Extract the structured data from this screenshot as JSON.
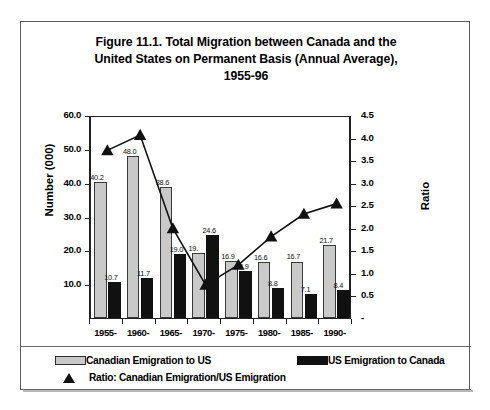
{
  "figure": {
    "title_lines": [
      "Figure 11.1. Total Migration between Canada and the",
      "United States on Permanent Basis (Annual Average),",
      "1955-96"
    ]
  },
  "axes": {
    "left_label": "Number (000)",
    "right_label": "Ratio",
    "left_ticks": [
      "60.0",
      "50.0",
      "40.0",
      "30.0",
      "20.0",
      "10.0"
    ],
    "right_ticks": [
      "4.5",
      "4.0",
      "3.5",
      "3.0",
      "2.5",
      "2.0",
      "1.5",
      "1.0",
      "0.5",
      "-"
    ]
  },
  "legend": {
    "items": [
      {
        "key": "canadian",
        "label": "Canadian Emigration to US",
        "marker": "light-swatch",
        "color": "#c9c9c9"
      },
      {
        "key": "us",
        "label": "US Emigration to Canada",
        "marker": "dark-swatch",
        "color": "#111111"
      },
      {
        "key": "ratio",
        "label": "Ratio: Canadian Emigration/US Emigration",
        "marker": "triangle",
        "color": "#111111"
      }
    ]
  },
  "chart_data": {
    "type": "bar",
    "title": "Figure 11.1. Total Migration between Canada and the United States on Permanent Basis (Annual Average), 1955-96",
    "xlabel": "",
    "ylabel": "Number (000)",
    "y2label": "Ratio",
    "categories": [
      "1955-",
      "1960-",
      "1965-",
      "1970-",
      "1975-",
      "1980-",
      "1985-",
      "1990-"
    ],
    "ylim": [
      0,
      60
    ],
    "y2lim": [
      0,
      4.5
    ],
    "grid": false,
    "legend_position": "bottom",
    "series": [
      {
        "name": "Canadian Emigration to US",
        "type": "bar",
        "axis": "left",
        "color": "#c9c9c9",
        "values": [
          40.2,
          48.0,
          38.6,
          19.1,
          16.9,
          16.6,
          16.7,
          21.7
        ],
        "labels": [
          "40.2",
          "48.0",
          "38.6",
          "19.",
          "16.9",
          "16.6",
          "16.7",
          "21.7"
        ]
      },
      {
        "name": "US Emigration to Canada",
        "type": "bar",
        "axis": "left",
        "color": "#111111",
        "values": [
          10.7,
          11.7,
          19.0,
          24.6,
          13.9,
          8.8,
          7.1,
          8.4
        ],
        "labels": [
          "10.7",
          "11.7",
          "19.0",
          "24.6",
          "13.9",
          "8.8",
          "7.1",
          "8.4"
        ]
      },
      {
        "name": "Ratio: Canadian Emigration/US Emigration",
        "type": "line",
        "axis": "right",
        "color": "#111111",
        "marker": "triangle",
        "values": [
          3.76,
          4.1,
          2.03,
          0.78,
          1.22,
          1.85,
          2.35,
          2.58
        ]
      }
    ]
  }
}
